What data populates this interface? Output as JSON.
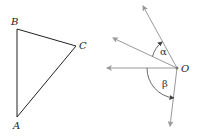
{
  "diagram": {
    "triangle": {
      "vertices": [
        {
          "name": "B",
          "x": 17,
          "y": 29
        },
        {
          "name": "C",
          "x": 76,
          "y": 46
        },
        {
          "name": "A",
          "x": 17,
          "y": 117
        }
      ],
      "labels": {
        "A": "A",
        "B": "B",
        "C": "C"
      },
      "stroke": "#222222"
    },
    "angle_figure": {
      "origin": {
        "name": "O",
        "x": 177,
        "y": 68
      },
      "origin_label": "O",
      "rays": [
        {
          "id": "ray-steep",
          "tip": [
            143,
            6
          ]
        },
        {
          "id": "ray-upper-left",
          "tip": [
            113,
            38
          ]
        },
        {
          "id": "ray-horizontal",
          "tip": [
            107,
            68
          ]
        },
        {
          "id": "ray-down",
          "tip": [
            170,
            126
          ]
        }
      ],
      "angles": [
        {
          "symbol": "α",
          "between": [
            "ray-upper-left",
            "ray-steep"
          ]
        },
        {
          "symbol": "β",
          "between": [
            "ray-horizontal",
            "ray-down"
          ]
        }
      ],
      "ray_color": "#999999",
      "arc_color": "#444444"
    }
  }
}
